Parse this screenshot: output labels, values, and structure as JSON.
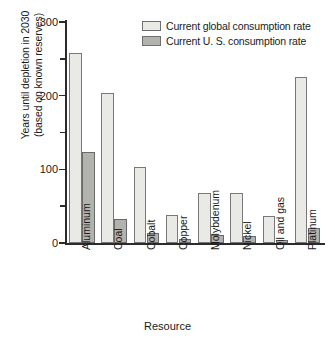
{
  "chart_data": {
    "type": "bar",
    "title": "",
    "xlabel": "Resource",
    "ylabel": "Years until depletion in 2030\n(based on known reserves)",
    "ylim": [
      0,
      300
    ],
    "ytick_labels": [
      "0",
      "100",
      "200",
      "300"
    ],
    "yticks": [
      0,
      100,
      200,
      300
    ],
    "yticks_minor": [
      50,
      150,
      250
    ],
    "grid": false,
    "legend_position": "top-right-inside",
    "categories": [
      "Aluminum",
      "Coal",
      "Cobalt",
      "Copper",
      "Molybdenum",
      "Nickel",
      "Oil and gas",
      "Platinum"
    ],
    "series": [
      {
        "name": "Current global consumption rate",
        "color": "#e9e9e6",
        "values": [
          258,
          204,
          103,
          38,
          68,
          68,
          36,
          226
        ]
      },
      {
        "name": "Current U. S. consumption rate",
        "color": "#b2b2ae",
        "values": [
          124,
          33,
          14,
          6,
          11,
          10,
          4,
          21
        ]
      }
    ]
  },
  "legend": {
    "items": [
      {
        "label": "Current global consumption rate",
        "swatch": "global"
      },
      {
        "label": "Current U. S. consumption rate",
        "swatch": "us"
      }
    ]
  },
  "axes": {
    "x_title": "Resource",
    "y_title_line1": "Years until depletion in 2030",
    "y_title_line2": "(based on known reserves)"
  }
}
